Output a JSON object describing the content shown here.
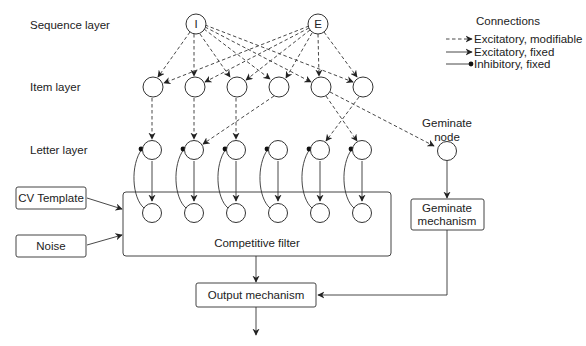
{
  "layers": {
    "sequence": "Sequence layer",
    "item": "Item layer",
    "letter": "Letter layer"
  },
  "sequence_nodes": [
    {
      "label": "I",
      "x": 196,
      "y": 24
    },
    {
      "label": "E",
      "x": 318,
      "y": 24
    }
  ],
  "item_nodes_x": [
    153,
    195,
    237,
    279,
    321,
    363
  ],
  "item_nodes_y": 87,
  "letter_nodes_x": [
    153,
    195,
    237,
    279,
    321,
    363
  ],
  "letter_nodes_y": 150,
  "filter_nodes_y": 213,
  "legend": {
    "title": "Connections",
    "items": [
      {
        "type": "dashed-arrow",
        "label": "Excitatory, modifiable"
      },
      {
        "type": "solid-arrow",
        "label": "Excitatory, fixed"
      },
      {
        "type": "solid-dot",
        "label": "Inhibitory, fixed"
      }
    ]
  },
  "geminate_node": {
    "label_line1": "Geminate",
    "label_line2": "node"
  },
  "boxes": {
    "cv_template": "CV Template",
    "noise": "Noise",
    "competitive_filter": "Competitive filter",
    "geminate_mechanism_line1": "Geminate",
    "geminate_mechanism_line2": "mechanism",
    "output_mechanism": "Output mechanism"
  },
  "colors": {
    "stroke": "#333333",
    "background": "#ffffff"
  }
}
